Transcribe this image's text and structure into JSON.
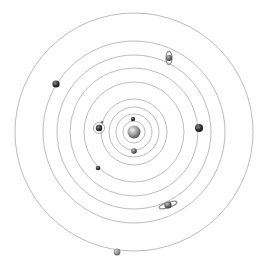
{
  "diagram": {
    "center": {
      "x": 134,
      "y": 132
    },
    "colors": {
      "background": "#ffffff",
      "orbit": "#b4b4b4",
      "sun_light": "#e6e6e6",
      "sun_dark": "#5a5a5a",
      "planet_light": "#a8a8a8",
      "planet_dark": "#1e1e1e"
    },
    "orbit_radii": [
      11,
      18,
      25,
      33,
      50,
      64,
      77,
      91,
      119
    ],
    "sun": {
      "name": "Sun",
      "x": 134,
      "y": 132,
      "r": 6.5
    },
    "planets": [
      {
        "name": "Mercury",
        "x": 133,
        "y": 119,
        "r": 2.2,
        "tone": "dark"
      },
      {
        "name": "Venus",
        "x": 134,
        "y": 151,
        "r": 2.8,
        "tone": "mid"
      },
      {
        "name": "Earth",
        "x": 99,
        "y": 128,
        "r": 3.2,
        "tone": "dark",
        "moon": {
          "x": 102,
          "y": 122,
          "r": 1.3,
          "orbit_r": 5.5
        }
      },
      {
        "name": "Mars",
        "x": 98,
        "y": 168,
        "r": 2.3,
        "tone": "dark"
      },
      {
        "name": "Jupiter",
        "x": 199,
        "y": 128,
        "r": 4,
        "tone": "dark"
      },
      {
        "name": "Saturn",
        "x": 168,
        "y": 205,
        "r": 3.6,
        "tone": "mid",
        "ring": "tilted"
      },
      {
        "name": "Uranus",
        "x": 169,
        "y": 58,
        "r": 3,
        "tone": "mid",
        "ring": "vertical"
      },
      {
        "name": "Neptune",
        "x": 56,
        "y": 84,
        "r": 3.6,
        "tone": "dark"
      },
      {
        "name": "Pluto",
        "x": 117,
        "y": 252,
        "r": 3.4,
        "tone": "light"
      }
    ]
  }
}
